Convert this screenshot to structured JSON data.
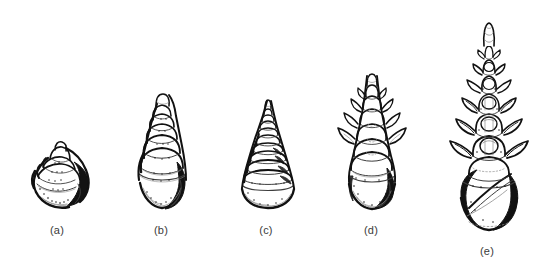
{
  "figure": {
    "background_color": "#ffffff",
    "ink_color": "#111111",
    "caption_color": "#3a3a3a",
    "specimen_count": 5
  },
  "specimens": [
    {
      "id": "a",
      "label": "(a)",
      "form": "squat low-spired shell, broad body whorl, few whorls",
      "whorl_count": 4,
      "ornament": "smooth",
      "height_px": 78,
      "width_px": 72
    },
    {
      "id": "b",
      "label": "(b)",
      "form": "conical shell, moderately elevated spire, rounded whorls",
      "whorl_count": 6,
      "ornament": "smooth, slightly shouldered",
      "height_px": 130,
      "width_px": 70
    },
    {
      "id": "c",
      "label": "(c)",
      "form": "regular stepped cone, many tightly stacked whorls",
      "whorl_count": 9,
      "ornament": "spiral ridges",
      "height_px": 133,
      "width_px": 72
    },
    {
      "id": "d",
      "label": "(d)",
      "form": "elevated spire with outward-curving horn-like spines on upper whorls",
      "whorl_count": 7,
      "ornament": "nodose spines",
      "height_px": 160,
      "width_px": 78
    },
    {
      "id": "e",
      "label": "(e)",
      "form": "greatly elongated spire with paired winged spines, large dark body whorl",
      "whorl_count": 8,
      "ornament": "strong paired lateral wings",
      "height_px": 240,
      "width_px": 78
    }
  ],
  "captions": [
    {
      "text": "(a)",
      "x": 57,
      "y": 231
    },
    {
      "text": "(b)",
      "x": 161,
      "y": 231
    },
    {
      "text": "(c)",
      "x": 266,
      "y": 231
    },
    {
      "text": "(d)",
      "x": 371,
      "y": 231
    },
    {
      "text": "(e)",
      "x": 487,
      "y": 250
    }
  ]
}
